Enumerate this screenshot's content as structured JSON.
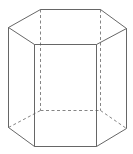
{
  "diagram": {
    "type": "hexagonal-prism",
    "colors": {
      "background": "#ffffff",
      "edge": "#555555",
      "hidden_edge": "#777777"
    },
    "vertices": {
      "top": {
        "A": [
          40,
          9
        ],
        "B": [
          100,
          9
        ],
        "C": [
          126,
          28
        ],
        "D": [
          96,
          44
        ],
        "E": [
          34,
          44
        ],
        "F": [
          8,
          27
        ]
      },
      "bottom": {
        "A": [
          40,
          110
        ],
        "B": [
          100,
          110
        ],
        "C": [
          126,
          128
        ],
        "D": [
          96,
          146
        ],
        "E": [
          34,
          146
        ],
        "F": [
          8,
          127
        ]
      }
    },
    "visible_edges": [
      [
        "topA",
        "topB"
      ],
      [
        "topB",
        "topC"
      ],
      [
        "topC",
        "topD"
      ],
      [
        "topD",
        "topE"
      ],
      [
        "topE",
        "topF"
      ],
      [
        "topF",
        "topA"
      ],
      [
        "topC",
        "botC"
      ],
      [
        "topD",
        "botD"
      ],
      [
        "topE",
        "botE"
      ],
      [
        "topF",
        "botF"
      ],
      [
        "botC",
        "botD"
      ],
      [
        "botD",
        "botE"
      ],
      [
        "botE",
        "botF"
      ]
    ],
    "hidden_edges": [
      [
        "topA",
        "botA"
      ],
      [
        "topB",
        "botB"
      ],
      [
        "botF",
        "botA"
      ],
      [
        "botA",
        "botB"
      ],
      [
        "botB",
        "botC"
      ]
    ]
  }
}
